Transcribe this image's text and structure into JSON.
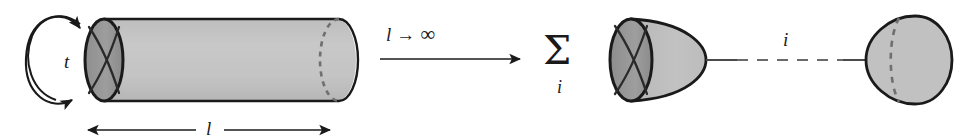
{
  "figure": {
    "background_color": "#ffffff",
    "stroke_color": "#1a1a1a",
    "surface_fill": "#c3c3c3",
    "cap_fill": "#9a9a9a",
    "dashed_color": "#6f6f6f"
  },
  "left_diagram": {
    "name": "cylinder-worldsheet",
    "loop_arrow": {
      "name": "time-loop-arrow",
      "label": "t"
    },
    "length_measure": {
      "name": "length-double-arrow",
      "label": "l"
    },
    "cylinder": {
      "near_cap_marking": "x-cross",
      "far_cap_marking": "dashed-ellipse"
    }
  },
  "limit_arrow": {
    "name": "limit-arrow",
    "variable": "l",
    "arrow": "→",
    "limit": "∞"
  },
  "right_diagram": {
    "name": "boundary-state-channel",
    "sum": {
      "symbol": "Σ",
      "index": "i"
    },
    "propagator": {
      "name": "propagator-line",
      "label": "i",
      "style": "dashed-with-solid-ends"
    },
    "left_cap": {
      "name": "left-boundary-state-cap",
      "marking": "x-cross"
    },
    "right_cap": {
      "name": "right-boundary-state-cap",
      "marking": "dashed-ellipse"
    }
  }
}
